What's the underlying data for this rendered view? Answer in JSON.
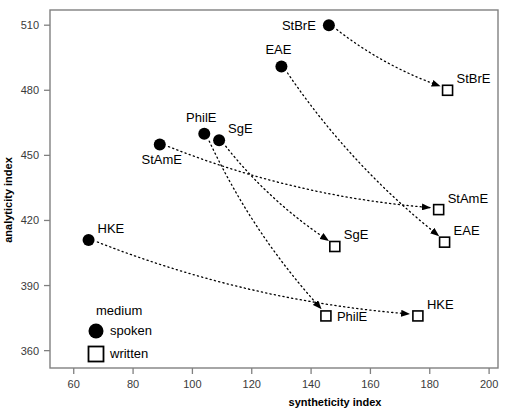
{
  "chart_data": {
    "type": "scatter",
    "title": "",
    "xlabel": "syntheticity index",
    "ylabel": "analyticity index",
    "xlim": [
      52,
      203
    ],
    "ylim": [
      352,
      517
    ],
    "xticks": [
      60,
      80,
      100,
      120,
      140,
      160,
      180,
      200
    ],
    "yticks": [
      360,
      390,
      420,
      450,
      480,
      510
    ],
    "grid": false,
    "legend": {
      "title": "medium",
      "position": "inside-lower-left",
      "entries": [
        {
          "label": "spoken",
          "marker": "filled-circle"
        },
        {
          "label": "written",
          "marker": "open-square"
        }
      ]
    },
    "series": [
      {
        "name": "spoken",
        "marker": "filled-circle",
        "points": [
          {
            "label": "StBrE",
            "x": 146,
            "y": 510,
            "label_side": "left"
          },
          {
            "label": "EAE",
            "x": 130,
            "y": 491,
            "label_side": "top"
          },
          {
            "label": "PhilE",
            "x": 104,
            "y": 460,
            "label_side": "top"
          },
          {
            "label": "SgE",
            "x": 109,
            "y": 457,
            "label_side": "topright"
          },
          {
            "label": "StAmE",
            "x": 89,
            "y": 455,
            "label_side": "bottom"
          },
          {
            "label": "HKE",
            "x": 65,
            "y": 411,
            "label_side": "topright"
          }
        ]
      },
      {
        "name": "written",
        "marker": "open-square",
        "points": [
          {
            "label": "StBrE",
            "x": 186,
            "y": 480,
            "label_side": "topright"
          },
          {
            "label": "StAmE",
            "x": 183,
            "y": 425,
            "label_side": "topright"
          },
          {
            "label": "EAE",
            "x": 185,
            "y": 410,
            "label_side": "topright"
          },
          {
            "label": "SgE",
            "x": 148,
            "y": 408,
            "label_side": "topright"
          },
          {
            "label": "HKE",
            "x": 176,
            "y": 376,
            "label_side": "topright"
          },
          {
            "label": "PhilE",
            "x": 145,
            "y": 376,
            "label_side": "right"
          }
        ]
      }
    ],
    "connectors": [
      {
        "variety": "StBrE",
        "from": [
          146,
          510
        ],
        "to": [
          186,
          480
        ],
        "style": "dotted-arrow"
      },
      {
        "variety": "EAE",
        "from": [
          130,
          491
        ],
        "to": [
          185,
          410
        ],
        "style": "dotted-arrow"
      },
      {
        "variety": "StAmE",
        "from": [
          89,
          455
        ],
        "to": [
          183,
          425
        ],
        "style": "dotted-arrow"
      },
      {
        "variety": "SgE",
        "from": [
          109,
          457
        ],
        "to": [
          148,
          408
        ],
        "style": "dotted-arrow"
      },
      {
        "variety": "PhilE",
        "from": [
          104,
          460
        ],
        "to": [
          145,
          376
        ],
        "style": "dotted-arrow"
      },
      {
        "variety": "HKE",
        "from": [
          65,
          411
        ],
        "to": [
          176,
          376
        ],
        "style": "dotted-arrow"
      }
    ]
  },
  "colors": {
    "frame": "#808080",
    "marker": "#000000",
    "tick_text": "#3a3a3a",
    "background": "#ffffff"
  }
}
